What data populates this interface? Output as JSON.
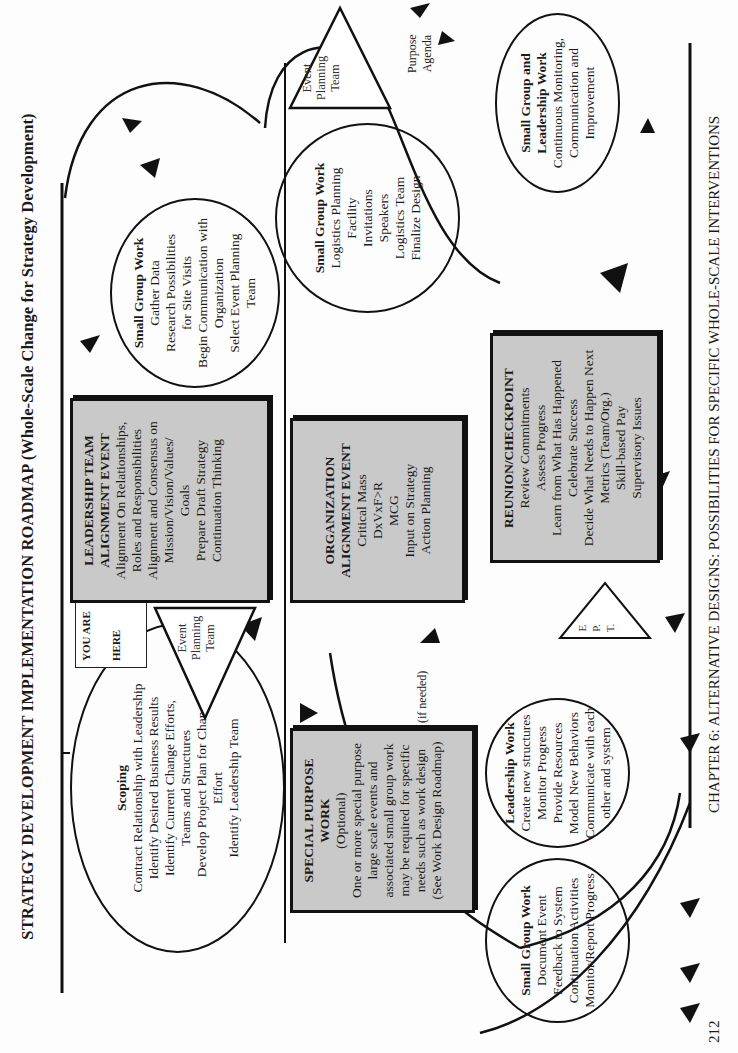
{
  "title": "STRATEGY DEVELOPMENT IMPLEMENTATION ROADMAP (Whole-Scale Change for Strategy Development)",
  "footer": {
    "page_number": "212",
    "chapter": "CHAPTER 6:  ALTERNATIVE DESIGNS:  POSSIBILITIES FOR SPECIFIC WHOLE-SCALE INTERVENTIONS"
  },
  "you_are_here": {
    "line1": "YOU ARE",
    "line2": "HERE"
  },
  "scoping": {
    "heading": "Scoping",
    "lines": [
      "Contract Relationship with Leadership",
      "Identify Desired Business Results",
      "Identify Current Change Efforts,",
      "Teams and Structures",
      "Develop Project Plan for Change",
      "Effort",
      "Identify Leadership Team"
    ]
  },
  "event_planning_team_1": {
    "lines": [
      "Event",
      "Planning",
      "Team"
    ]
  },
  "leadership_alignment": {
    "heading1": "LEADERSHIP TEAM",
    "heading2": "ALIGNMENT EVENT",
    "lines": [
      "Alignment On Relationships,",
      "Roles and Responsibilities",
      "Alignment and Consensus on",
      "Mission/Vision/Values/",
      "Goals",
      "Prepare Draft Strategy",
      "Continuation Thinking"
    ]
  },
  "small_group_1": {
    "heading": "Small Group Work",
    "lines": [
      "Gather Data",
      "Research Possibilities",
      "for Site Visits",
      "Begin Communication with",
      "Organization",
      "Select Event Planning",
      "Team"
    ]
  },
  "small_group_logistics": {
    "heading": "Small Group Work",
    "lines": [
      "Logistics Planning",
      "Facility",
      "Invitations",
      "Speakers",
      "Logistics Team",
      "Finalize Design"
    ]
  },
  "event_planning_team_2": {
    "lines": [
      "Event",
      "Planning",
      "Team"
    ],
    "note_lines": [
      "Purpose",
      "Agenda"
    ]
  },
  "org_alignment": {
    "heading1": "ORGANIZATION",
    "heading2": "ALIGNMENT EVENT",
    "lines": [
      "Critical Mass",
      "DxVxF>R",
      "MCG",
      "Input on Strategy",
      "Action Planning"
    ]
  },
  "special_purpose": {
    "heading1": "SPECIAL PURPOSE",
    "heading2": "WORK",
    "lines": [
      "(Optional)",
      "One or more special purpose",
      "large scale events and",
      "associated small group work",
      "may be required for specific",
      "needs such as work design",
      "(See Work Design Roadmap)"
    ]
  },
  "if_needed": "(if needed)",
  "leadership_work": {
    "heading": "Leadership Work",
    "lines": [
      "Create new structures",
      "Monitor Progress",
      "Provide Resources",
      "Model New Behaviors",
      "Communicate with each",
      "other and system"
    ]
  },
  "small_group_document": {
    "heading": "Small Group Work",
    "lines": [
      "Document Event",
      "Feedback to System",
      "Continuation Activities",
      "Monitor/Report Progress"
    ]
  },
  "ept": {
    "lines": [
      "E",
      "P.",
      "T."
    ]
  },
  "reunion": {
    "heading": "REUNION/CHECKPOINT",
    "lines": [
      "Review Commitments",
      "Assess Progress",
      "Learn from What Has Happened",
      "Celebrate Success",
      "Decide What Needs to Happen Next",
      "Metrics (Team/Org.)",
      "Skill-based Pay",
      "Supervisory Issues"
    ]
  },
  "continuous": {
    "heading1": "Small Group and",
    "heading2": "Leadership Work",
    "lines": [
      "Continuous Monitoring,",
      "Communication and",
      "Improvement"
    ]
  },
  "colors": {
    "box_fill": "#c9c9c9",
    "ink": "#111111",
    "page": "#fdfdfd"
  }
}
